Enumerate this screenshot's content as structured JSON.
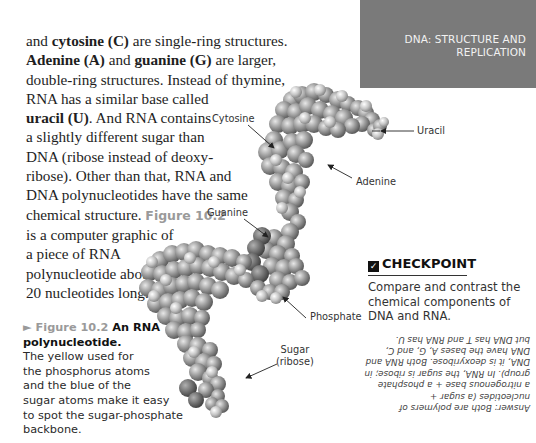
{
  "header": {
    "title_line1": "DNA: STRUCTURE AND",
    "title_line2": "REPLICATION"
  },
  "body_text": {
    "l1_b": "cytosine (C)",
    "l1_pre": "and ",
    "l1_post": " are single-ring structures.",
    "l2_b1": "Adenine (A)",
    "l2_mid": " and ",
    "l2_b2": "guanine (G)",
    "l2_post": " are larger,",
    "l3": "double-ring structures. Instead of thymine,",
    "l4": "RNA has a similar base called",
    "l5_b": "uracil (U)",
    "l5_post": ". And RNA contains",
    "l6": "a slightly different sugar than",
    "l7": "DNA (ribose instead of deoxy-",
    "l8": "ribose). Other than that, RNA and",
    "l9": "DNA polynucleotides have the same",
    "l10_pre": "chemical structure. ",
    "l10_fig": "Figure 10.2",
    "l11": "is a computer graphic of",
    "l12": "a piece of RNA",
    "l13": "polynucleotide about",
    "l14": "20 nucleotides long. ",
    "check_glyph": "✓"
  },
  "figure": {
    "labels": {
      "cytosine": "Cytosine",
      "uracil": "Uracil",
      "adenine": "Adenine",
      "guanine": "Guanine",
      "phosphate": "Phosphate",
      "sugar_line1": "Sugar",
      "sugar_line2": "(ribose)"
    },
    "caption": {
      "fig_label": "► Figure 10.2",
      "title1": " An RNA",
      "title2": "polynucleotide.",
      "lines": [
        "The yellow used for",
        "the phosphorus atoms",
        "and the blue of the",
        "sugar atoms make it easy",
        "to spot the sugar-phosphate",
        "backbone."
      ]
    }
  },
  "checkpoint": {
    "glyph": "✓",
    "title": "CHECKPOINT",
    "question_lines": [
      "Compare and contrast the",
      "chemical components of",
      "DNA and RNA."
    ],
    "answer_lines": [
      "Answer: Both are polymers of",
      "nucleotides (a sugar +",
      "a nitrogenous base + a phosphate",
      "group). In RNA, the sugar is ribose; in",
      "DNA, it is deoxyribose. Both RNA and",
      "DNA have the bases A, G, and C,",
      "but DNA has T and RNA has U."
    ]
  }
}
